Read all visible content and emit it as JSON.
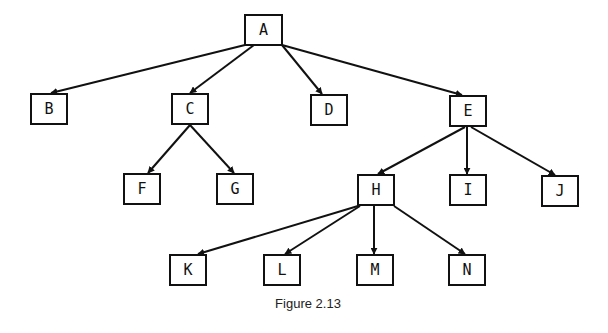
{
  "figure": {
    "caption": "Figure 2.13",
    "stroke_color": "#111111",
    "background": "#ffffff"
  },
  "nodes": [
    {
      "id": "A",
      "label": "A",
      "x": 244,
      "y": 14,
      "w": 39,
      "h": 32
    },
    {
      "id": "B",
      "label": "B",
      "x": 30,
      "y": 93,
      "w": 38,
      "h": 32
    },
    {
      "id": "C",
      "label": "C",
      "x": 171,
      "y": 93,
      "w": 38,
      "h": 32
    },
    {
      "id": "D",
      "label": "D",
      "x": 310,
      "y": 94,
      "w": 38,
      "h": 32
    },
    {
      "id": "E",
      "label": "E",
      "x": 449,
      "y": 95,
      "w": 38,
      "h": 32
    },
    {
      "id": "F",
      "label": "F",
      "x": 123,
      "y": 173,
      "w": 38,
      "h": 32
    },
    {
      "id": "G",
      "label": "G",
      "x": 216,
      "y": 173,
      "w": 38,
      "h": 32
    },
    {
      "id": "H",
      "label": "H",
      "x": 357,
      "y": 174,
      "w": 38,
      "h": 32
    },
    {
      "id": "I",
      "label": "I",
      "x": 449,
      "y": 174,
      "w": 38,
      "h": 32
    },
    {
      "id": "J",
      "label": "J",
      "x": 541,
      "y": 175,
      "w": 38,
      "h": 32
    },
    {
      "id": "K",
      "label": "K",
      "x": 169,
      "y": 254,
      "w": 38,
      "h": 32
    },
    {
      "id": "L",
      "label": "L",
      "x": 263,
      "y": 254,
      "w": 38,
      "h": 32
    },
    {
      "id": "M",
      "label": "M",
      "x": 356,
      "y": 254,
      "w": 38,
      "h": 32
    },
    {
      "id": "N",
      "label": "N",
      "x": 448,
      "y": 254,
      "w": 38,
      "h": 32
    }
  ],
  "edges": [
    {
      "from": "A",
      "to": "B",
      "x1": 245,
      "y1": 45,
      "x2": 51,
      "y2": 93
    },
    {
      "from": "A",
      "to": "C",
      "x1": 254,
      "y1": 45,
      "x2": 190,
      "y2": 93
    },
    {
      "from": "A",
      "to": "D",
      "x1": 282,
      "y1": 45,
      "x2": 322,
      "y2": 94
    },
    {
      "from": "A",
      "to": "E",
      "x1": 282,
      "y1": 45,
      "x2": 462,
      "y2": 95
    },
    {
      "from": "C",
      "to": "F",
      "x1": 190,
      "y1": 125,
      "x2": 148,
      "y2": 173
    },
    {
      "from": "C",
      "to": "G",
      "x1": 190,
      "y1": 125,
      "x2": 234,
      "y2": 173
    },
    {
      "from": "E",
      "to": "H",
      "x1": 465,
      "y1": 127,
      "x2": 378,
      "y2": 174
    },
    {
      "from": "E",
      "to": "I",
      "x1": 467,
      "y1": 127,
      "x2": 467,
      "y2": 174
    },
    {
      "from": "E",
      "to": "J",
      "x1": 471,
      "y1": 127,
      "x2": 555,
      "y2": 175
    },
    {
      "from": "H",
      "to": "K",
      "x1": 358,
      "y1": 206,
      "x2": 198,
      "y2": 254
    },
    {
      "from": "H",
      "to": "L",
      "x1": 360,
      "y1": 206,
      "x2": 285,
      "y2": 254
    },
    {
      "from": "H",
      "to": "M",
      "x1": 374,
      "y1": 206,
      "x2": 374,
      "y2": 254
    },
    {
      "from": "H",
      "to": "N",
      "x1": 394,
      "y1": 206,
      "x2": 465,
      "y2": 254
    }
  ]
}
